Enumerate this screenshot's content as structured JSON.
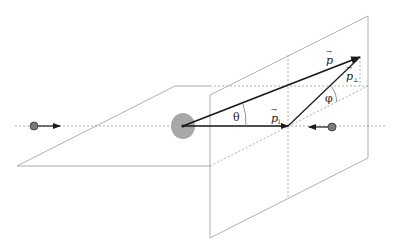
{
  "diagram": {
    "labels": {
      "p": "p",
      "p_long": "p",
      "p_long_sub": "L",
      "p_perp": "p",
      "p_perp_sub": "⊥",
      "theta": "θ",
      "phi": "φ",
      "vector_arrow": "→"
    },
    "colors": {
      "plane_line": "#9a9a9a",
      "dashed_line": "#9a9a9a",
      "vector": "#1a1a1a",
      "particle": "#7a7a7a",
      "nucleus": "#a8a8a8"
    }
  }
}
